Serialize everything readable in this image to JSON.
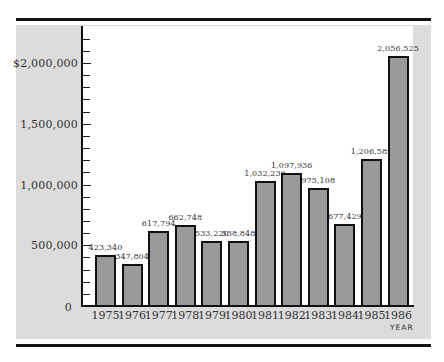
{
  "chart_data": {
    "type": "bar",
    "title": "",
    "xlabel": "YEAR",
    "ylabel": "",
    "categories": [
      "1975",
      "1976",
      "1977",
      "1978",
      "1979",
      "1980",
      "1981",
      "1982",
      "1983",
      "1984",
      "1985",
      "1986"
    ],
    "values": [
      423340,
      347804,
      617794,
      662748,
      533220,
      538848,
      1032236,
      1097936,
      975108,
      677429,
      1206589,
      2056525
    ],
    "value_labels": [
      "423,340",
      "347,804",
      "617,794",
      "662,748",
      "533,220",
      "538,848",
      "1,032,236",
      "1,097,936",
      "975,108",
      "677,429",
      "1,206,589",
      "2,056,525"
    ],
    "ylim": [
      0,
      2300000
    ],
    "y_ticks": [
      {
        "value": 0,
        "label": "0"
      },
      {
        "value": 500000,
        "label": "500,000"
      },
      {
        "value": 1000000,
        "label": "1,000,000"
      },
      {
        "value": 1500000,
        "label": "1,500,000"
      },
      {
        "value": 2000000,
        "label": "$2,000,000"
      }
    ],
    "minor_tick_step": 100000,
    "grid": false,
    "legend": null,
    "bar_color": "#9a9a9a",
    "bar_edge_color": "#111111",
    "panel_color": "#dcdcdc"
  }
}
